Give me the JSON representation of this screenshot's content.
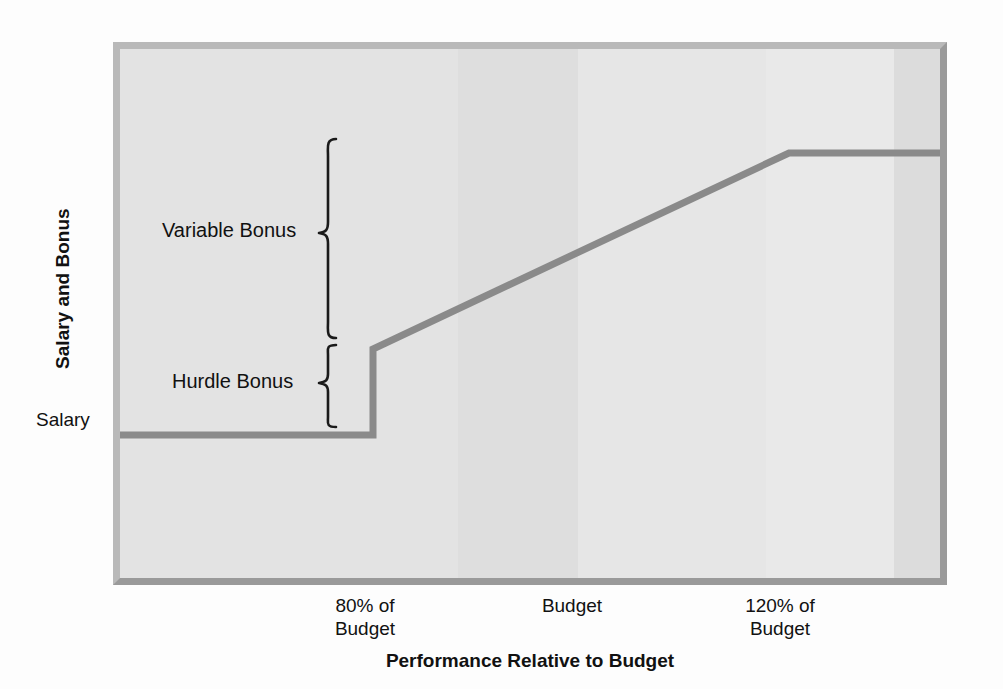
{
  "figure": {
    "y_axis_title": "Salary and Bonus",
    "x_axis_title": "Performance Relative to Budget",
    "salary_tick_label": "Salary",
    "annotations": {
      "variable_bonus": "Variable Bonus",
      "hurdle_bonus": "Hurdle Bonus"
    },
    "x_tick_labels": [
      "80% of\nBudget",
      "Budget",
      "120% of\nBudget"
    ],
    "colors": {
      "plot_background": "#e6e6e6",
      "frame_light": "#b9b9b9",
      "frame_dark": "#9a9a9a",
      "series_line": "#8a8a8a",
      "brace_ink": "#1a1a1a",
      "text": "#111111",
      "page_background": "#fdfdfd"
    }
  },
  "chart_data": {
    "type": "line",
    "title": "",
    "subtitle": "",
    "xlabel": "Performance Relative to Budget",
    "ylabel": "Salary and Bonus",
    "grid": false,
    "legend": "none",
    "x_tick_labels": [
      "80% of Budget",
      "Budget",
      "120% of Budget"
    ],
    "x_tick_values": [
      80,
      100,
      120
    ],
    "y_tick_labels": [
      "Salary"
    ],
    "xlim": [
      60,
      135
    ],
    "ylim": [
      0,
      1.45
    ],
    "series": [
      {
        "name": "Total Compensation",
        "x": [
          60,
          80,
          80,
          120,
          135
        ],
        "y": [
          1.0,
          1.0,
          1.27,
          1.62,
          1.62
        ],
        "description": "Flat salary up to 80% of budget, step up by the hurdle bonus at 80% of budget, then a linear ramp of variable bonus to a cap reached at 120% of budget, then flat."
      }
    ],
    "annotations": [
      {
        "label": "Salary",
        "type": "y-level",
        "y": 1.0,
        "note": "Base salary paid regardless of performance"
      },
      {
        "label": "Hurdle Bonus",
        "type": "brace",
        "y_from": 1.0,
        "y_to": 1.27,
        "note": "Step bonus earned on reaching 80% of budget"
      },
      {
        "label": "Variable Bonus",
        "type": "brace",
        "y_from": 1.27,
        "y_to": 1.62,
        "note": "Incremental bonus earned between 80% and 120% of budget"
      }
    ]
  }
}
